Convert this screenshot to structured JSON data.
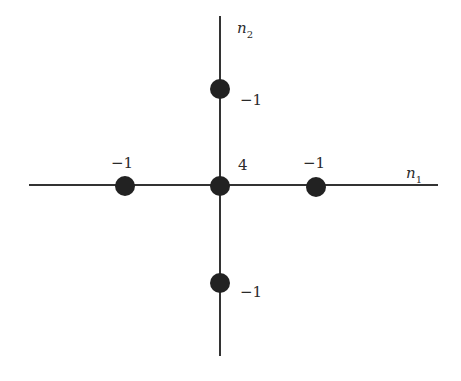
{
  "diagram": {
    "title": "",
    "axes": {
      "horizontal": {
        "label": "n",
        "subscript": "1"
      },
      "vertical": {
        "label": "n",
        "subscript": "2"
      }
    },
    "points": [
      {
        "name": "center",
        "coord": [
          0,
          0
        ],
        "value": "4"
      },
      {
        "name": "left",
        "coord": [
          -1,
          0
        ],
        "value": "−1"
      },
      {
        "name": "right",
        "coord": [
          1,
          0
        ],
        "value": "−1"
      },
      {
        "name": "top",
        "coord": [
          0,
          1
        ],
        "value": "−1"
      },
      {
        "name": "bottom",
        "coord": [
          0,
          -1
        ],
        "value": "−1"
      }
    ],
    "colors": {
      "line": "#333333",
      "point": "#222222"
    }
  }
}
